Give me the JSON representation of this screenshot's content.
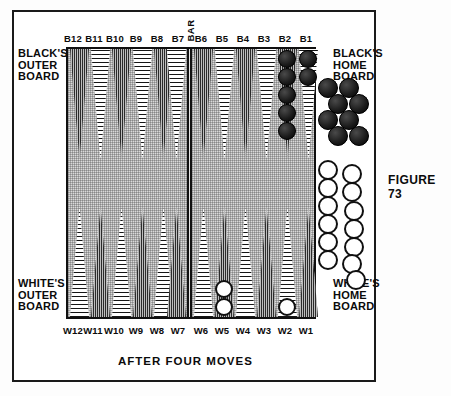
{
  "figure": {
    "number_label": "FIGURE 73",
    "caption": "AFTER FOUR MOVES"
  },
  "board": {
    "bar_label": "BAR",
    "quadrants": {
      "black_outer": "BLACK'S\nOUTER\nBOARD",
      "black_outer_lines": [
        "BLACK'S",
        "OUTER",
        "BOARD"
      ],
      "black_home_lines": [
        "BLACK'S",
        "HOME",
        "BOARD"
      ],
      "white_outer_lines": [
        "WHITE'S",
        "OUTER",
        "BOARD"
      ],
      "white_home_lines": [
        "WHITE'S",
        "HOME",
        "BOARD"
      ]
    },
    "top_point_labels": [
      "B12",
      "B11",
      "B10",
      "B9",
      "B8",
      "B7",
      "B6",
      "B5",
      "B4",
      "B3",
      "B2",
      "B1"
    ],
    "bottom_point_labels": [
      "W12",
      "W11",
      "W10",
      "W9",
      "W8",
      "W7",
      "W6",
      "W5",
      "W4",
      "W3",
      "W2",
      "W1"
    ],
    "colors": {
      "board_field": "#d9d9d9",
      "dark_point": "#a8a8a8",
      "light_point": "#ffffff",
      "black_checker": "#1c1c1c",
      "white_checker": "#ffffff",
      "frame": "#101010"
    },
    "point_shading": {
      "top": [
        "dark",
        "light",
        "dark",
        "light",
        "dark",
        "light",
        "dark",
        "light",
        "dark",
        "light",
        "dark",
        "light"
      ],
      "bottom": [
        "light",
        "dark",
        "light",
        "dark",
        "light",
        "dark",
        "light",
        "dark",
        "light",
        "dark",
        "light",
        "dark"
      ]
    },
    "checkers_on_points": [
      {
        "point": "B2",
        "color": "black",
        "count": 5
      },
      {
        "point": "B1",
        "color": "black",
        "count": 2
      },
      {
        "point": "W5",
        "color": "white",
        "count": 2
      },
      {
        "point": "W2",
        "color": "white",
        "count": 1
      }
    ],
    "tray": {
      "black_off_count": 8,
      "white_off_count": 13
    }
  }
}
